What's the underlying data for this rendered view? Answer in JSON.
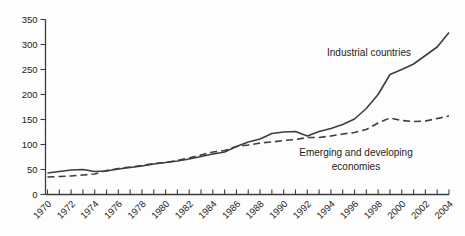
{
  "chart_data": {
    "type": "line",
    "title": "",
    "xlabel": "",
    "ylabel": "",
    "x": [
      1970,
      1971,
      1972,
      1973,
      1974,
      1975,
      1976,
      1977,
      1978,
      1979,
      1980,
      1981,
      1982,
      1983,
      1984,
      1985,
      1986,
      1987,
      1988,
      1989,
      1990,
      1991,
      1992,
      1993,
      1994,
      1995,
      1996,
      1997,
      1998,
      1999,
      2000,
      2001,
      2002,
      2003,
      2004
    ],
    "series": [
      {
        "name": "Industrial countries",
        "style": "solid",
        "color": "#3d3d3d",
        "values": [
          43,
          46,
          49,
          50,
          46,
          47,
          51,
          54,
          57,
          61,
          64,
          67,
          71,
          76,
          81,
          85,
          96,
          105,
          111,
          122,
          125,
          126,
          117,
          126,
          132,
          140,
          151,
          172,
          200,
          240,
          250,
          261,
          278,
          295,
          324
        ]
      },
      {
        "name": "Emerging and developing economies",
        "style": "dashed",
        "color": "#3d3d3d",
        "values": [
          35,
          36,
          37,
          39,
          41,
          48,
          52,
          55,
          58,
          62,
          64,
          68,
          73,
          79,
          85,
          88,
          96,
          99,
          103,
          105,
          108,
          110,
          114,
          114,
          117,
          121,
          124,
          130,
          143,
          153,
          148,
          146,
          147,
          152,
          157
        ]
      }
    ],
    "ylim": [
      0,
      350
    ],
    "yticks": [
      0,
      50,
      100,
      150,
      200,
      250,
      300,
      350
    ],
    "ytick_labels": [
      "0",
      "50",
      "100",
      "150",
      "200",
      "250",
      "300",
      "350"
    ],
    "xtick_minor_every": 1,
    "xtick_label_years": [
      "1970",
      "1972",
      "1974",
      "1976",
      "1978",
      "1980",
      "1982",
      "1984",
      "1986",
      "1988",
      "1990",
      "1992",
      "1994",
      "1996",
      "1998",
      "2000",
      "2002",
      "2004"
    ],
    "grid": false,
    "legend_position": "in-plot-annotations",
    "annotations": [
      {
        "name": "industrial-countries-label",
        "lines": [
          "Industrial countries"
        ],
        "x": 369,
        "y": 56
      },
      {
        "name": "emerging-economies-label",
        "lines": [
          "Emerging and developing",
          "economies"
        ],
        "x": 356,
        "y": 156
      }
    ],
    "axis_color": "#3d3d3d",
    "text_color": "#1c1c1c"
  }
}
